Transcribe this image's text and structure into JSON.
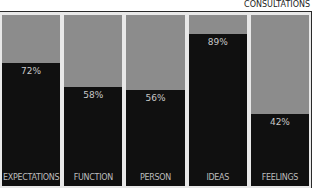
{
  "chart_data": {
    "type": "bar",
    "stacked": true,
    "title": "CONSULTATIONS",
    "categories": [
      "EXPECTATIONS",
      "FUNCTION",
      "PERSON",
      "IDEAS",
      "FEELINGS"
    ],
    "values": [
      72,
      58,
      56,
      89,
      42
    ],
    "value_labels": [
      "72%",
      "58%",
      "56%",
      "89%",
      "42%"
    ],
    "series": [
      {
        "name": "value",
        "values": [
          72,
          58,
          56,
          89,
          42
        ],
        "color": "#101010"
      },
      {
        "name": "remainder",
        "values": [
          28,
          42,
          44,
          11,
          58
        ],
        "color": "#8c8c8c"
      }
    ],
    "xlabel": "",
    "ylabel": "",
    "ylim": [
      0,
      100
    ],
    "grid": false,
    "legend": "none"
  },
  "colors": {
    "fill": "#101010",
    "remainder": "#8c8c8c",
    "gap": "#e8e8e8",
    "frame": "#2a2a2a"
  }
}
